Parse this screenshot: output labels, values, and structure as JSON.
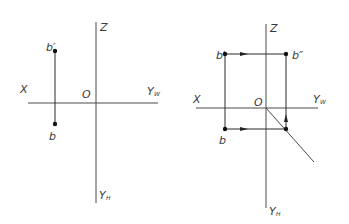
{
  "figure": {
    "left_panel": {
      "labels": {
        "z": "Z",
        "x": "X",
        "origin": "O",
        "yw_main": "Y",
        "yw_sub": "W",
        "yh_main": "Y",
        "yh_sub": "H",
        "b_prime": "b′",
        "b": "b"
      }
    },
    "right_panel": {
      "labels": {
        "z": "Z",
        "x": "X",
        "origin": "O",
        "yw_main": "Y",
        "yw_sub": "W",
        "yh_main": "Y",
        "yh_sub": "H",
        "b_prime": "b′",
        "b_double_prime": "b″",
        "b": "b"
      }
    },
    "colors": {
      "line": "#4a4a4a",
      "point": "#111111",
      "background": "#ffffff"
    }
  }
}
